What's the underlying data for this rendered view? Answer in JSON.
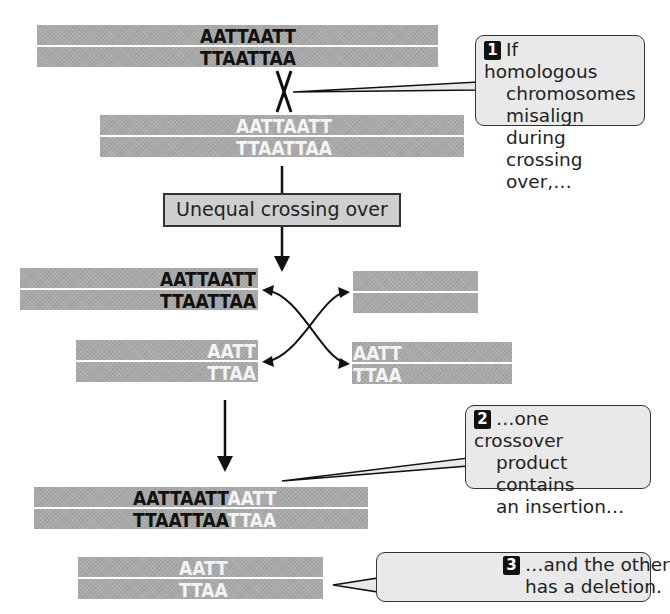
{
  "figure": {
    "colors": {
      "chromosome_fill": "#a9a9a9",
      "dark_sequence": "#111111",
      "light_sequence": "#f4f4f4",
      "callout_fill": "#e9e9e9",
      "label_box_fill": "#cfcfcf",
      "badge_fill": "#111111"
    },
    "top_chromosome": {
      "strand1": "AATTAATT",
      "strand2": "TTAATTAA"
    },
    "misaligned_chromosome": {
      "strand1": "AATTAATT",
      "strand2": "TTAATTAA"
    },
    "crossover_marker": "X",
    "process_label": "Unequal crossing over",
    "products_before_joining": {
      "left_top": {
        "strand1": "AATTAATT",
        "strand2": "TTAATTAA"
      },
      "right_top": {
        "strand1": "",
        "strand2": ""
      },
      "left_bottom": {
        "strand1": "AATT",
        "strand2": "TTAA"
      },
      "right_bottom": {
        "strand1": "AATT",
        "strand2": "TTAA"
      }
    },
    "insertion_product": {
      "strand1_dark": "AATTAATT",
      "strand1_light": "AATT",
      "strand2_dark": "TTAATTAA",
      "strand2_light": "TTAA"
    },
    "deletion_product": {
      "strand1": "AATT",
      "strand2": "TTAA"
    },
    "callouts": [
      {
        "number": "1",
        "lines": [
          "If homologous",
          "chromosomes",
          "misalign during",
          "crossing over,…"
        ]
      },
      {
        "number": "2",
        "lines": [
          "…one crossover",
          "product contains",
          "an insertion…"
        ]
      },
      {
        "number": "3",
        "lines": [
          "…and the other",
          "has a deletion."
        ]
      }
    ]
  }
}
